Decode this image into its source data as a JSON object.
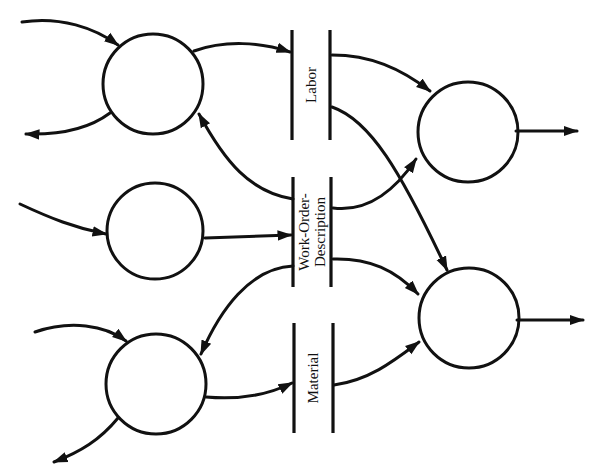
{
  "diagram": {
    "type": "data-flow-diagram",
    "colors": {
      "line": "#111111",
      "background": "#ffffff"
    },
    "processes": [
      {
        "id": "p1",
        "position": "top-left"
      },
      {
        "id": "p2",
        "position": "middle-left"
      },
      {
        "id": "p3",
        "position": "bottom-left"
      },
      {
        "id": "p4",
        "position": "top-right"
      },
      {
        "id": "p5",
        "position": "bottom-right"
      }
    ],
    "stores": {
      "labor": {
        "label": "Labor"
      },
      "work_order": {
        "line1": "Work-Order-",
        "line2": "Description"
      },
      "material": {
        "label": "Material"
      }
    },
    "flows": [
      {
        "from": "external",
        "to": "p1"
      },
      {
        "from": "p1",
        "to": "external"
      },
      {
        "from": "p1",
        "to": "Labor"
      },
      {
        "from": "Work-Order-Description",
        "to": "p1"
      },
      {
        "from": "external",
        "to": "p2"
      },
      {
        "from": "p2",
        "to": "Work-Order-Description"
      },
      {
        "from": "external",
        "to": "p3"
      },
      {
        "from": "p3",
        "to": "external"
      },
      {
        "from": "p3",
        "to": "Material"
      },
      {
        "from": "Work-Order-Description",
        "to": "p3"
      },
      {
        "from": "Labor",
        "to": "p4"
      },
      {
        "from": "Work-Order-Description",
        "to": "p4"
      },
      {
        "from": "p4",
        "to": "external"
      },
      {
        "from": "Labor",
        "to": "p5"
      },
      {
        "from": "Work-Order-Description",
        "to": "p5"
      },
      {
        "from": "Material",
        "to": "p5"
      },
      {
        "from": "p5",
        "to": "external"
      }
    ]
  }
}
